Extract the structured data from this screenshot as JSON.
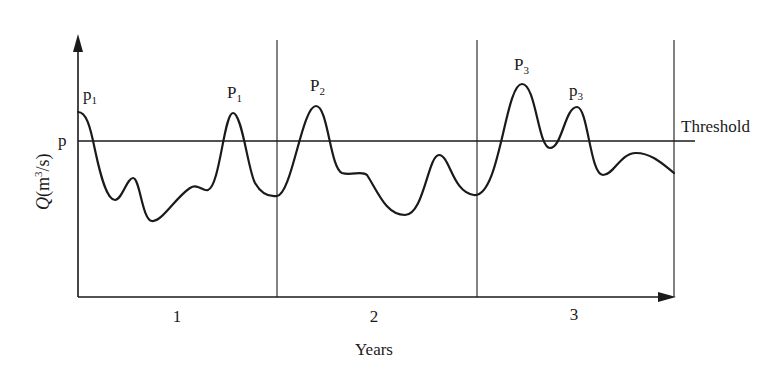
{
  "diagram": {
    "type": "hydrograph-threshold",
    "y_axis_label_var": "Q",
    "y_axis_label_unit_pre": "(m",
    "y_axis_label_unit_sup": "3",
    "y_axis_label_unit_post": "/s)",
    "x_axis_label": "Years",
    "threshold_label": "Threshold",
    "threshold_tick_label": "p",
    "year_labels": [
      "1",
      "2",
      "3"
    ],
    "peak_labels": [
      {
        "base": "p",
        "sub": "1"
      },
      {
        "base": "P",
        "sub": "1"
      },
      {
        "base": "P",
        "sub": "2"
      },
      {
        "base": "P",
        "sub": "3"
      },
      {
        "base": "p",
        "sub": "3"
      }
    ],
    "colors": {
      "line": "#1a1a1a",
      "background": "#ffffff"
    }
  }
}
